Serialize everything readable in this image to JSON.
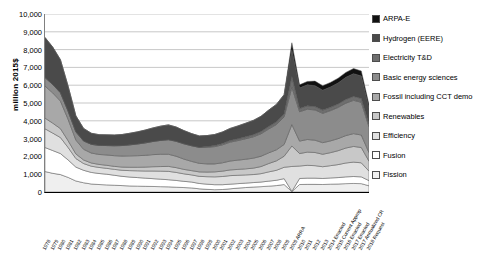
{
  "chart_data": {
    "type": "area",
    "stacked": true,
    "title": "",
    "xlabel": "",
    "ylabel": "million 2015$",
    "ylim": [
      0,
      10000
    ],
    "ytick_values": [
      0,
      1000,
      2000,
      3000,
      4000,
      5000,
      6000,
      7000,
      8000,
      9000,
      10000
    ],
    "ytick_labels": [
      "0",
      "1,000",
      "2,000",
      "3,000",
      "4,000",
      "5,000",
      "6,000",
      "7,000",
      "8,000",
      "9,000",
      "10,000"
    ],
    "grid": true,
    "legend_position": "right",
    "categories": [
      "1978",
      "1979",
      "1980",
      "1981",
      "1982",
      "1983",
      "1984",
      "1985",
      "1986",
      "1987",
      "1988",
      "1989",
      "1990",
      "1991",
      "1992",
      "1993",
      "1994",
      "1995",
      "1996",
      "1997",
      "1998",
      "1999",
      "2000",
      "2001",
      "2002",
      "2003",
      "2004",
      "2005",
      "2006",
      "2007",
      "2008",
      "2009",
      "2009 ARRA",
      "2010",
      "2011",
      "2012",
      "2013",
      "2014 Enacted",
      "2015 Current Approp",
      "2016 Enacted",
      "2017 Enacted",
      "2017 Annualized CR",
      "2018 Request"
    ],
    "series": [
      {
        "name": "Fission",
        "color": "#efefef",
        "values": [
          1150,
          1050,
          980,
          820,
          620,
          520,
          450,
          420,
          400,
          380,
          360,
          340,
          330,
          320,
          310,
          300,
          290,
          270,
          250,
          230,
          180,
          150,
          130,
          140,
          180,
          220,
          250,
          280,
          300,
          330,
          360,
          420,
          20,
          420,
          430,
          430,
          420,
          440,
          450,
          470,
          480,
          470,
          350
        ]
      },
      {
        "name": "Fusion",
        "color": "#ffffff",
        "values": [
          1350,
          1280,
          1180,
          980,
          780,
          700,
          650,
          620,
          600,
          560,
          520,
          500,
          480,
          460,
          440,
          420,
          400,
          380,
          350,
          330,
          300,
          290,
          280,
          270,
          260,
          250,
          250,
          250,
          260,
          280,
          300,
          330,
          15,
          340,
          350,
          350,
          340,
          350,
          360,
          380,
          390,
          380,
          290
        ]
      },
      {
        "name": "Efficiency",
        "color": "#e0e0e0",
        "values": [
          1050,
          980,
          900,
          700,
          480,
          380,
          350,
          340,
          330,
          330,
          340,
          360,
          380,
          400,
          430,
          450,
          470,
          450,
          420,
          400,
          400,
          420,
          440,
          460,
          480,
          470,
          460,
          450,
          470,
          520,
          560,
          640,
          1400,
          700,
          720,
          700,
          660,
          690,
          730,
          780,
          810,
          790,
          530
        ]
      },
      {
        "name": "Renewables",
        "color": "#c8c8c8",
        "values": [
          600,
          560,
          500,
          380,
          260,
          200,
          180,
          170,
          170,
          170,
          180,
          190,
          200,
          220,
          240,
          260,
          280,
          270,
          250,
          240,
          250,
          260,
          280,
          300,
          320,
          330,
          340,
          360,
          400,
          470,
          530,
          620,
          1150,
          700,
          740,
          740,
          700,
          730,
          780,
          840,
          880,
          860,
          560
        ]
      },
      {
        "name": "Fossil including CCT demo",
        "color": "#a8a8a8",
        "values": [
          1800,
          1700,
          1550,
          1200,
          780,
          600,
          560,
          560,
          580,
          600,
          620,
          640,
          650,
          660,
          680,
          690,
          680,
          640,
          580,
          520,
          480,
          460,
          450,
          470,
          500,
          520,
          540,
          560,
          580,
          600,
          620,
          660,
          1200,
          700,
          710,
          690,
          650,
          660,
          680,
          700,
          720,
          700,
          480
        ]
      },
      {
        "name": "Basic energy sciences",
        "color": "#8c8c8c",
        "values": [
          480,
          470,
          470,
          460,
          460,
          470,
          490,
          510,
          530,
          560,
          590,
          620,
          660,
          700,
          740,
          780,
          820,
          840,
          860,
          880,
          900,
          930,
          970,
          1010,
          1060,
          1100,
          1150,
          1200,
          1260,
          1340,
          1420,
          1550,
          2100,
          1650,
          1700,
          1700,
          1650,
          1700,
          1750,
          1820,
          1870,
          1840,
          1450
        ]
      },
      {
        "name": "Electricity T&D",
        "color": "#6e6e6e",
        "values": [
          0,
          0,
          0,
          0,
          0,
          0,
          0,
          0,
          0,
          0,
          0,
          0,
          0,
          0,
          0,
          0,
          0,
          0,
          0,
          0,
          0,
          40,
          60,
          80,
          90,
          100,
          110,
          120,
          130,
          140,
          150,
          170,
          600,
          180,
          190,
          190,
          180,
          185,
          195,
          210,
          220,
          215,
          160
        ]
      },
      {
        "name": "Hydrogen (EERE)",
        "color": "#4a4a4a",
        "values": [
          2250,
          2100,
          1850,
          1400,
          900,
          700,
          620,
          600,
          600,
          600,
          620,
          650,
          680,
          720,
          760,
          800,
          830,
          800,
          740,
          680,
          640,
          620,
          620,
          640,
          680,
          720,
          760,
          800,
          850,
          920,
          980,
          1080,
          1500,
          1150,
          1180,
          1170,
          1120,
          1140,
          1180,
          1240,
          1280,
          1260,
          900
        ]
      },
      {
        "name": "ARPA-E",
        "color": "#111111",
        "values": [
          0,
          0,
          0,
          0,
          0,
          0,
          0,
          0,
          0,
          0,
          0,
          0,
          0,
          0,
          0,
          0,
          0,
          0,
          0,
          0,
          0,
          0,
          0,
          0,
          0,
          0,
          0,
          0,
          0,
          0,
          0,
          0,
          400,
          180,
          190,
          260,
          250,
          260,
          270,
          280,
          290,
          285,
          190
        ]
      }
    ],
    "legend_entries": [
      {
        "label": "ARPA-E",
        "color": "#111111"
      },
      {
        "label": "Hydrogen (EERE)",
        "color": "#4a4a4a"
      },
      {
        "label": "Electricity T&D",
        "color": "#6e6e6e"
      },
      {
        "label": "Basic energy sciences",
        "color": "#8c8c8c"
      },
      {
        "label": "Fossil including CCT demo",
        "color": "#a8a8a8"
      },
      {
        "label": "Renewables",
        "color": "#c8c8c8"
      },
      {
        "label": "Efficiency",
        "color": "#e0e0e0"
      },
      {
        "label": "Fusion",
        "color": "#ffffff"
      },
      {
        "label": "Fission",
        "color": "#efefef"
      }
    ],
    "xtick_labels": [
      "1978",
      "1979",
      "1980",
      "1981",
      "1982",
      "1983",
      "1984",
      "1985",
      "1986",
      "1987",
      "1988",
      "1989",
      "1990",
      "1991",
      "1992",
      "1993",
      "1994",
      "1995",
      "1996",
      "1997",
      "1998",
      "1999",
      "2000",
      "2001",
      "2002",
      "2003",
      "2004",
      "2005",
      "2006",
      "2007",
      "2008",
      "2009",
      "2009 ARRA",
      "2010",
      "2011",
      "2012",
      "2013",
      "2014 Enacted",
      "2015 Current Approp",
      "2016 Enacted",
      "2017 Enacted",
      "2017 Annualized CR",
      "2018 Request"
    ]
  }
}
